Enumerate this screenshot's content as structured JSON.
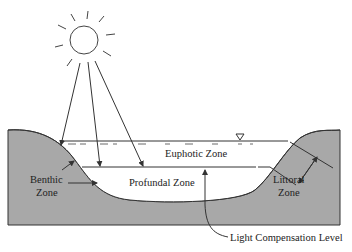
{
  "diagram": {
    "labels": {
      "euphotic": "Euphotic Zone",
      "profundal": "Profundal Zone",
      "benthic_line1": "Benthic",
      "benthic_line2": "Zone",
      "littoral_line1": "Littoral",
      "littoral_line2": "Zone",
      "light_compensation": "Light Compensation Level"
    },
    "icons": {
      "sun": "sun-icon",
      "water_level": "water-level-triangle-icon"
    },
    "colors": {
      "ground": "#a8a8a8",
      "water": "#ffffff",
      "lines": "#333333"
    }
  }
}
